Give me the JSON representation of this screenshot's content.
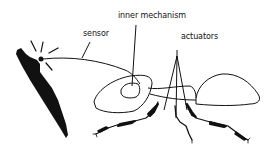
{
  "diagram": {
    "labels": {
      "sensor": "sensor",
      "inner_mechanism": "inner mechanism",
      "actuators": "actuators"
    },
    "colors": {
      "ink": "#111111",
      "background": "#ffffff"
    }
  }
}
